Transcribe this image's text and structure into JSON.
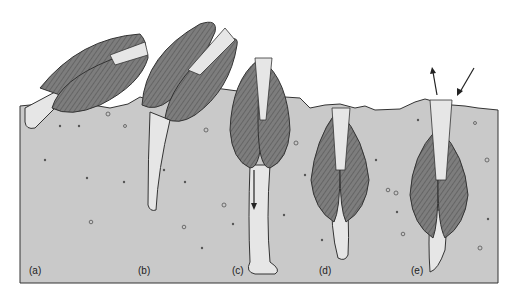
{
  "figure": {
    "colors": {
      "background": "#ffffff",
      "sediment": "#c9c9c9",
      "sediment_outline": "#333333",
      "shell": "#7d7d7d",
      "shell_dark": "#4a4a4a",
      "foot": "#e6e6e6",
      "particles": "#555555"
    },
    "panels": [
      {
        "id": "a",
        "label": "(a)"
      },
      {
        "id": "b",
        "label": "(b)"
      },
      {
        "id": "c",
        "label": "(c)"
      },
      {
        "id": "d",
        "label": "(d)"
      },
      {
        "id": "e",
        "label": "(e)"
      }
    ],
    "arrows": [
      {
        "panel": "c",
        "direction": "down",
        "meaning": "foot extends downward"
      },
      {
        "panel": "e",
        "direction": "up-left",
        "meaning": "water expelled"
      },
      {
        "panel": "e",
        "direction": "down-left",
        "meaning": "water drawn in"
      }
    ]
  }
}
